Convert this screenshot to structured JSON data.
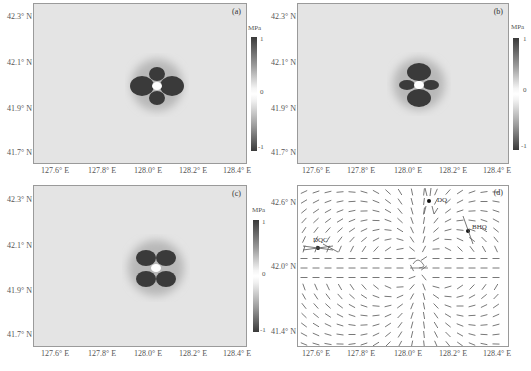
{
  "chart_data": [
    {
      "type": "heatmap",
      "panel": "(a)",
      "xlabel": "",
      "ylabel": "",
      "x_ticks": [
        "127.6° E",
        "127.8° E",
        "128.0° E",
        "128.2° E",
        "128.4° E"
      ],
      "y_ticks": [
        "42.3° N",
        "42.1° N",
        "41.9° N",
        "41.7° N"
      ],
      "colorbar": {
        "unit": "MPa",
        "ticks": [
          "1",
          "0",
          "-1"
        ],
        "range": [
          -1,
          1
        ]
      },
      "pattern": "four-lobe stress pattern centered near 128.05° E, 42.0° N; lobes left/right large, top/bottom smaller",
      "center": [
        128.05,
        42.0
      ]
    },
    {
      "type": "heatmap",
      "panel": "(b)",
      "x_ticks": [
        "127.6° E",
        "127.8° E",
        "128.0° E",
        "128.2° E",
        "128.4° E"
      ],
      "y_ticks": [
        "42.3° N",
        "42.1° N",
        "41.9° N",
        "41.7° N"
      ],
      "colorbar": {
        "unit": "MPa",
        "ticks": [
          "1",
          "0",
          "-1"
        ],
        "range": [
          -1,
          1
        ]
      },
      "pattern": "four-lobe stress pattern centered near 128.05° E, 42.0° N; top/bottom lobes large, left/right smaller",
      "center": [
        128.05,
        42.0
      ]
    },
    {
      "type": "heatmap",
      "panel": "(c)",
      "x_ticks": [
        "127.6° E",
        "127.8° E",
        "128.0° E",
        "128.2° E",
        "128.4° E"
      ],
      "y_ticks": [
        "42.3° N",
        "42.1° N",
        "41.9° N",
        "41.7° N"
      ],
      "colorbar": {
        "unit": "MPa",
        "ticks": [
          "1",
          "0",
          "-1"
        ],
        "range": [
          -1,
          1
        ]
      },
      "pattern": "four-lobe stress pattern in diagonal quadrants centered near 128.05° E, 42.0° N",
      "center": [
        128.05,
        42.0
      ]
    },
    {
      "type": "vector-field",
      "panel": "(d)",
      "x_ticks": [
        "127.6° E",
        "127.8° E",
        "128.0° E",
        "128.2° E",
        "128.4° E"
      ],
      "y_ticks": [
        "42.6° N",
        "42.0° N",
        "41.4° N"
      ],
      "stations": [
        {
          "name": "DQ",
          "lon": 128.1,
          "lat": 42.55
        },
        {
          "name": "BHQ",
          "lon": 128.3,
          "lat": 42.38
        },
        {
          "name": "DQC",
          "lon": 127.63,
          "lat": 42.17
        }
      ],
      "source_marker": {
        "lon": 128.02,
        "lat": 42.0
      }
    }
  ],
  "panels": {
    "a": {
      "tag": "(a)",
      "unit": "MPa",
      "cb_max": "1",
      "cb_mid": "0",
      "cb_min": "-1",
      "y": [
        "42.3° N",
        "42.1° N",
        "41.9° N",
        "41.7° N"
      ],
      "x": [
        "127.6° E",
        "127.8° E",
        "128.0° E",
        "128.2° E",
        "128.4° E"
      ]
    },
    "b": {
      "tag": "(b)",
      "unit": "MPa",
      "cb_max": "1",
      "cb_mid": "0",
      "cb_min": "-1",
      "y": [
        "42.3° N",
        "42.1° N",
        "41.9° N",
        "41.7° N"
      ],
      "x": [
        "127.6° E",
        "127.8° E",
        "128.0° E",
        "128.2° E",
        "128.4° E"
      ]
    },
    "c": {
      "tag": "(c)",
      "unit": "MPa",
      "cb_max": "1",
      "cb_mid": "0",
      "cb_min": "-1",
      "y": [
        "42.3° N",
        "42.1° N",
        "41.9° N",
        "41.7° N"
      ],
      "x": [
        "127.6° E",
        "127.8° E",
        "128.0° E",
        "128.2° E",
        "128.4° E"
      ]
    },
    "d": {
      "tag": "(d)",
      "y": [
        "42.6° N",
        "42.0° N",
        "41.4° N"
      ],
      "x": [
        "127.6° E",
        "127.8° E",
        "128.0° E",
        "128.2° E",
        "128.4° E"
      ],
      "stations": [
        "DQ",
        "BHQ",
        "DQC"
      ]
    }
  }
}
